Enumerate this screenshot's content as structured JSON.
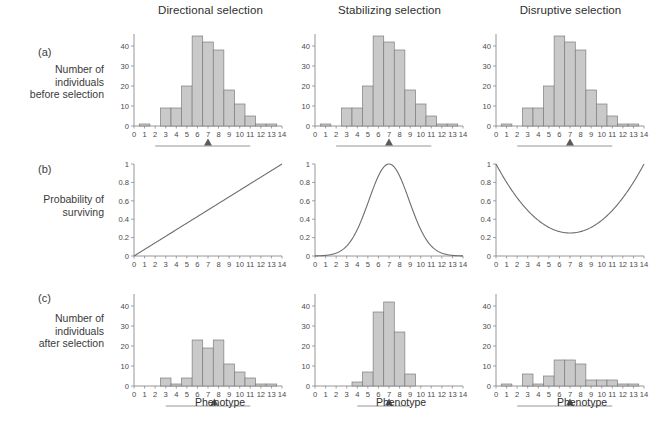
{
  "figure": {
    "columns": [
      {
        "id": "directional",
        "title": "Directional selection"
      },
      {
        "id": "stabilizing",
        "title": "Stabilizing selection"
      },
      {
        "id": "disruptive",
        "title": "Disruptive selection"
      }
    ],
    "rows": [
      {
        "letter": "(a)",
        "label": "Number of\nindividuals\nbefore selection"
      },
      {
        "letter": "(b)",
        "label": "Probability of\nsurviving"
      },
      {
        "letter": "(c)",
        "label": "Number of\nindividuals\nafter selection"
      }
    ],
    "xaxis_title": "Phenotype",
    "colors": {
      "bar_fill": "#c9c9c9",
      "bar_stroke": "#7d7d7d",
      "axis": "#8a8a8a",
      "curve": "#6d6d6d",
      "marker": "#5a5a5a",
      "text": "#3a3a3a",
      "background": "#ffffff"
    }
  },
  "chart_data": [
    {
      "type": "bar",
      "panel": "a1",
      "row": "(a)",
      "column": "Directional selection",
      "title": "",
      "xlabel": "Phenotype",
      "ylabel": "Number of individuals before selection",
      "categories": [
        0,
        1,
        2,
        3,
        4,
        5,
        6,
        7,
        8,
        9,
        10,
        11,
        12,
        13,
        14
      ],
      "values": [
        0,
        1,
        0,
        9,
        9,
        20,
        45,
        42,
        38,
        18,
        11,
        5,
        1,
        1,
        0
      ],
      "xlim": [
        0,
        14
      ],
      "ylim": [
        0,
        46
      ],
      "yticks": [
        0,
        10,
        20,
        30,
        40
      ],
      "xticks": [
        0,
        1,
        2,
        3,
        4,
        5,
        6,
        7,
        8,
        9,
        10,
        11,
        12,
        13,
        14
      ],
      "grid": false,
      "legend": "none",
      "annotations": {
        "range_bar": [
          2,
          11
        ],
        "mean_marker": 7
      }
    },
    {
      "type": "bar",
      "panel": "a2",
      "row": "(a)",
      "column": "Stabilizing selection",
      "title": "",
      "xlabel": "Phenotype",
      "ylabel": "Number of individuals before selection",
      "categories": [
        0,
        1,
        2,
        3,
        4,
        5,
        6,
        7,
        8,
        9,
        10,
        11,
        12,
        13,
        14
      ],
      "values": [
        0,
        1,
        0,
        9,
        9,
        20,
        45,
        42,
        38,
        18,
        11,
        5,
        1,
        1,
        0
      ],
      "xlim": [
        0,
        14
      ],
      "ylim": [
        0,
        46
      ],
      "yticks": [
        0,
        10,
        20,
        30,
        40
      ],
      "xticks": [
        0,
        1,
        2,
        3,
        4,
        5,
        6,
        7,
        8,
        9,
        10,
        11,
        12,
        13,
        14
      ],
      "grid": false,
      "legend": "none",
      "annotations": {
        "range_bar": [
          2,
          11
        ],
        "mean_marker": 7
      }
    },
    {
      "type": "bar",
      "panel": "a3",
      "row": "(a)",
      "column": "Disruptive selection",
      "title": "",
      "xlabel": "Phenotype",
      "ylabel": "Number of individuals before selection",
      "categories": [
        0,
        1,
        2,
        3,
        4,
        5,
        6,
        7,
        8,
        9,
        10,
        11,
        12,
        13,
        14
      ],
      "values": [
        0,
        1,
        0,
        9,
        9,
        20,
        45,
        42,
        38,
        18,
        11,
        5,
        1,
        1,
        0
      ],
      "xlim": [
        0,
        14
      ],
      "ylim": [
        0,
        46
      ],
      "yticks": [
        0,
        10,
        20,
        30,
        40
      ],
      "xticks": [
        0,
        1,
        2,
        3,
        4,
        5,
        6,
        7,
        8,
        9,
        10,
        11,
        12,
        13,
        14
      ],
      "grid": false,
      "legend": "none",
      "annotations": {
        "range_bar": [
          2,
          11
        ],
        "mean_marker": 7
      }
    },
    {
      "type": "line",
      "panel": "b1",
      "row": "(b)",
      "column": "Directional selection",
      "title": "",
      "xlabel": "Phenotype",
      "ylabel": "Probability of surviving",
      "curve_shape": "linear-increasing",
      "x": [
        0,
        1,
        2,
        3,
        4,
        5,
        6,
        7,
        8,
        9,
        10,
        11,
        12,
        13,
        14
      ],
      "y": [
        0,
        0.071,
        0.143,
        0.214,
        0.286,
        0.357,
        0.429,
        0.5,
        0.571,
        0.643,
        0.714,
        0.786,
        0.857,
        0.929,
        1.0
      ],
      "xlim": [
        0,
        14
      ],
      "ylim": [
        0,
        1
      ],
      "yticks": [
        0,
        0.2,
        0.4,
        0.6,
        0.8,
        1
      ],
      "ytick_labels": [
        "0",
        "0.2",
        "0.4",
        "0.6",
        "0.8",
        "1"
      ],
      "xticks": [
        0,
        1,
        2,
        3,
        4,
        5,
        6,
        7,
        8,
        9,
        10,
        11,
        12,
        13,
        14
      ],
      "grid": false,
      "legend": "none"
    },
    {
      "type": "line",
      "panel": "b2",
      "row": "(b)",
      "column": "Stabilizing selection",
      "title": "",
      "xlabel": "Phenotype",
      "ylabel": "Probability of surviving",
      "curve_shape": "gaussian-peak",
      "peak_x": 7,
      "peak_y": 1.0,
      "sigma": 1.9,
      "x": [
        0,
        1,
        2,
        3,
        4,
        5,
        6,
        7,
        8,
        9,
        10,
        11,
        12,
        13,
        14
      ],
      "y": [
        0.005,
        0.017,
        0.055,
        0.148,
        0.34,
        0.64,
        0.93,
        1.0,
        0.93,
        0.64,
        0.34,
        0.148,
        0.055,
        0.017,
        0.005
      ],
      "xlim": [
        0,
        14
      ],
      "ylim": [
        0,
        1
      ],
      "yticks": [
        0,
        0.2,
        0.4,
        0.6,
        0.8,
        1
      ],
      "ytick_labels": [
        "0",
        "0.2",
        "0.4",
        "0.6",
        "0.8",
        "1"
      ],
      "xticks": [
        0,
        1,
        2,
        3,
        4,
        5,
        6,
        7,
        8,
        9,
        10,
        11,
        12,
        13,
        14
      ],
      "grid": false,
      "legend": "none"
    },
    {
      "type": "line",
      "panel": "b3",
      "row": "(b)",
      "column": "Disruptive selection",
      "title": "",
      "xlabel": "Phenotype",
      "ylabel": "Probability of surviving",
      "curve_shape": "u-shaped",
      "min_x": 7,
      "min_y": 0.25,
      "x": [
        0,
        1,
        2,
        3,
        4,
        5,
        6,
        7,
        8,
        9,
        10,
        11,
        12,
        13,
        14
      ],
      "y": [
        1.0,
        0.78,
        0.59,
        0.44,
        0.33,
        0.27,
        0.25,
        0.25,
        0.26,
        0.3,
        0.38,
        0.5,
        0.66,
        0.84,
        1.0
      ],
      "xlim": [
        0,
        14
      ],
      "ylim": [
        0,
        1
      ],
      "yticks": [
        0,
        0.2,
        0.4,
        0.6,
        0.8,
        1
      ],
      "ytick_labels": [
        "0",
        "0.2",
        "0.4",
        "0.6",
        "0.8",
        "1"
      ],
      "xticks": [
        0,
        1,
        2,
        3,
        4,
        5,
        6,
        7,
        8,
        9,
        10,
        11,
        12,
        13,
        14
      ],
      "grid": false,
      "legend": "none"
    },
    {
      "type": "bar",
      "panel": "c1",
      "row": "(c)",
      "column": "Directional selection",
      "title": "",
      "xlabel": "Phenotype",
      "ylabel": "Number of individuals after selection",
      "categories": [
        0,
        1,
        2,
        3,
        4,
        5,
        6,
        7,
        8,
        9,
        10,
        11,
        12,
        13,
        14
      ],
      "values": [
        0,
        0,
        0,
        4,
        1,
        4,
        23,
        19,
        23,
        11,
        7,
        4,
        1,
        1,
        0
      ],
      "xlim": [
        0,
        14
      ],
      "ylim": [
        0,
        46
      ],
      "yticks": [
        0,
        10,
        20,
        30,
        40
      ],
      "xticks": [
        0,
        1,
        2,
        3,
        4,
        5,
        6,
        7,
        8,
        9,
        10,
        11,
        12,
        13,
        14
      ],
      "grid": false,
      "legend": "none",
      "annotations": {
        "range_bar": [
          3,
          11
        ],
        "mean_marker": 7.6
      }
    },
    {
      "type": "bar",
      "panel": "c2",
      "row": "(c)",
      "column": "Stabilizing selection",
      "title": "",
      "xlabel": "Phenotype",
      "ylabel": "Number of individuals after selection",
      "categories": [
        0,
        1,
        2,
        3,
        4,
        5,
        6,
        7,
        8,
        9,
        10,
        11,
        12,
        13,
        14
      ],
      "values": [
        0,
        0,
        0,
        0,
        2,
        7,
        37,
        42,
        27,
        6,
        0,
        0,
        0,
        0,
        0
      ],
      "xlim": [
        0,
        14
      ],
      "ylim": [
        0,
        46
      ],
      "yticks": [
        0,
        10,
        20,
        30,
        40
      ],
      "xticks": [
        0,
        1,
        2,
        3,
        4,
        5,
        6,
        7,
        8,
        9,
        10,
        11,
        12,
        13,
        14
      ],
      "grid": false,
      "legend": "none",
      "annotations": {
        "range_bar": [
          4,
          9
        ],
        "mean_marker": 7
      }
    },
    {
      "type": "bar",
      "panel": "c3",
      "row": "(c)",
      "column": "Disruptive selection",
      "title": "",
      "xlabel": "Phenotype",
      "ylabel": "Number of individuals after selection",
      "categories": [
        0,
        1,
        2,
        3,
        4,
        5,
        6,
        7,
        8,
        9,
        10,
        11,
        12,
        13,
        14
      ],
      "values": [
        0,
        1,
        0,
        6,
        1,
        5,
        13,
        13,
        11,
        3,
        3,
        3,
        1,
        1,
        0
      ],
      "xlim": [
        0,
        14
      ],
      "ylim": [
        0,
        46
      ],
      "yticks": [
        0,
        10,
        20,
        30,
        40
      ],
      "xticks": [
        0,
        1,
        2,
        3,
        4,
        5,
        6,
        7,
        8,
        9,
        10,
        11,
        12,
        13,
        14
      ],
      "grid": false,
      "legend": "none",
      "annotations": {
        "range_bar": [
          2,
          11
        ],
        "mean_marker": 7
      }
    }
  ]
}
